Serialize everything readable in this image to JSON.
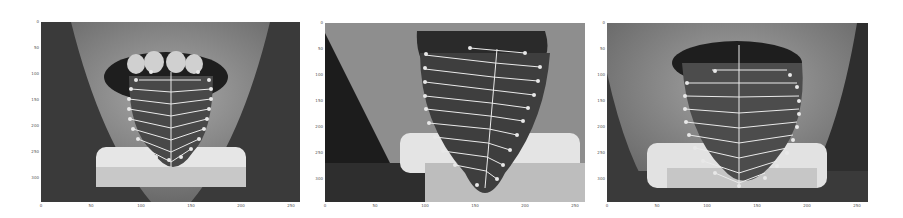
{
  "figure": {
    "panels": [
      {
        "id": "panel-1",
        "x_ticks": [
          "0",
          "50",
          "100",
          "150",
          "200",
          "250"
        ],
        "y_ticks": [
          "0",
          "50",
          "100",
          "150",
          "200",
          "250",
          "300"
        ],
        "landmark_color": "#e8e8e8"
      },
      {
        "id": "panel-2",
        "x_ticks": [
          "0",
          "50",
          "100",
          "150",
          "200",
          "250"
        ],
        "y_ticks": [
          "0",
          "50",
          "100",
          "150",
          "200",
          "250",
          "300"
        ],
        "landmark_color": "#e8e8e8"
      },
      {
        "id": "panel-3",
        "x_ticks": [
          "0",
          "50",
          "100",
          "150",
          "200",
          "250"
        ],
        "y_ticks": [
          "0",
          "50",
          "100",
          "150",
          "200",
          "250",
          "300"
        ],
        "landmark_color": "#e8e8e8"
      }
    ]
  }
}
